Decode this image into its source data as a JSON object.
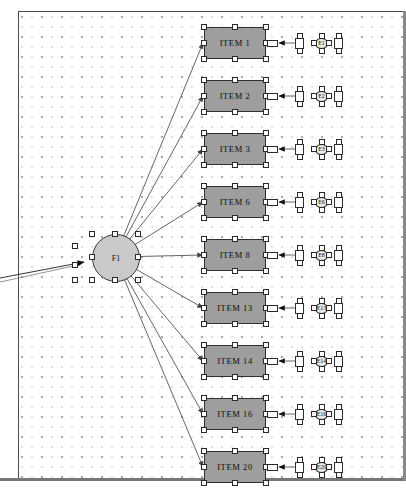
{
  "diagram": {
    "latent": {
      "label": "F1",
      "x": 92,
      "y": 234,
      "w": 46,
      "h": 46,
      "fill": "#c9c9c9",
      "stroke": "#3a3a3a",
      "selected": true
    },
    "observed_fill": "#9e9e9e",
    "observed_stroke": "#2f2f2f",
    "handle_fill": "#ffffff",
    "grid_dot_color": "#787880",
    "canvas_bg": "#ffffff",
    "items": [
      {
        "label": "ITEM 1",
        "error": "E1",
        "x": 204,
        "y": 27,
        "w": 62,
        "h": 32
      },
      {
        "label": "ITEM 2",
        "error": "E2",
        "x": 204,
        "y": 80,
        "w": 62,
        "h": 32
      },
      {
        "label": "ITEM 3",
        "error": "E3",
        "x": 204,
        "y": 133,
        "w": 62,
        "h": 32
      },
      {
        "label": "ITEM 6",
        "error": "E6",
        "x": 204,
        "y": 186,
        "w": 62,
        "h": 32
      },
      {
        "label": "ITEM 8",
        "error": "E8",
        "x": 204,
        "y": 239,
        "w": 62,
        "h": 32
      },
      {
        "label": "ITEM 13",
        "error": "E13",
        "x": 204,
        "y": 292,
        "w": 62,
        "h": 32
      },
      {
        "label": "ITEM 14",
        "error": "E14",
        "x": 204,
        "y": 345,
        "w": 62,
        "h": 32
      },
      {
        "label": "ITEM 16",
        "error": "E16",
        "x": 204,
        "y": 398,
        "w": 62,
        "h": 32
      },
      {
        "label": "ITEM 20",
        "error": "E20",
        "x": 204,
        "y": 451,
        "w": 62,
        "h": 32
      }
    ],
    "exogenous_arrow": {
      "description": "incoming-path-arrow-from-left",
      "from_x": 0,
      "from_y": 278,
      "to_x": 84,
      "to_y": 262
    }
  }
}
